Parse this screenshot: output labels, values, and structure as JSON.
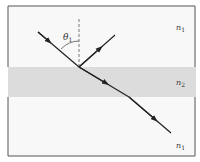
{
  "figure": {
    "colors": {
      "background": "#f7f7f7",
      "frame": "#555555",
      "slab": "#d9d9d9",
      "ray": "#222222",
      "normal": "#555555"
    },
    "labels": {
      "theta": "θ",
      "theta_sub": "1",
      "top_medium": "n",
      "top_medium_sub": "1",
      "slab_medium": "n",
      "slab_medium_sub": "2",
      "bottom_medium": "n",
      "bottom_medium_sub": "1"
    }
  }
}
